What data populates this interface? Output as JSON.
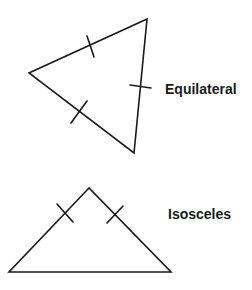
{
  "colors": {
    "background": "#ffffff",
    "stroke": "#1a1a1a",
    "text": "#1a1a1a"
  },
  "diagram": {
    "shapes": [
      {
        "name": "equilateral-triangle",
        "label": "Equilateral",
        "vertices": [
          [
            147,
            19
          ],
          [
            29,
            73
          ],
          [
            134,
            153
          ]
        ],
        "tick_marks": [
          [
            [
              87,
              36
            ],
            [
              94,
              57
            ]
          ],
          [
            [
              87,
              101
            ],
            [
              71,
              123
            ]
          ],
          [
            [
              130,
              85
            ],
            [
              151,
              88
            ]
          ]
        ]
      },
      {
        "name": "isosceles-triangle",
        "label": "Isosceles",
        "vertices": [
          [
            89,
            188
          ],
          [
            9,
            272
          ],
          [
            171,
            272
          ]
        ],
        "tick_marks": [
          [
            [
              57,
              204
            ],
            [
              73,
              222
            ]
          ],
          [
            [
              123,
              206
            ],
            [
              107,
              223
            ]
          ]
        ]
      }
    ]
  }
}
